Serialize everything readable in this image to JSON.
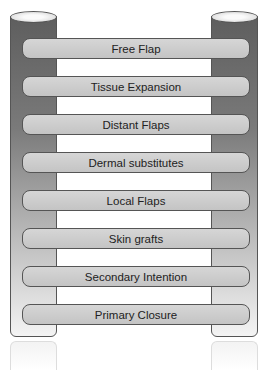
{
  "diagram": {
    "type": "reconstructive ladder",
    "rungs": [
      {
        "label": "Free Flap"
      },
      {
        "label": "Tissue Expansion"
      },
      {
        "label": "Distant Flaps"
      },
      {
        "label": "Dermal substitutes"
      },
      {
        "label": "Local Flaps"
      },
      {
        "label": "Skin grafts"
      },
      {
        "label": "Secondary Intention"
      },
      {
        "label": "Primary Closure"
      }
    ],
    "colors": {
      "pillar_top": "#5e5e5e",
      "pillar_bottom": "#f4f4f4",
      "rung_fill": "#cccccc",
      "border": "#555555"
    }
  }
}
